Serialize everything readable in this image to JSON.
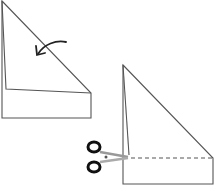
{
  "diagram": {
    "steps": [
      {
        "id": "step-1",
        "action": "fold",
        "icon": "curved-arrow-icon"
      },
      {
        "id": "step-2",
        "action": "cut",
        "icon": "scissors-icon",
        "cut_line": "dashed"
      }
    ],
    "colors": {
      "line": "#555555",
      "background": "#ffffff",
      "scissors": "#111111"
    }
  }
}
